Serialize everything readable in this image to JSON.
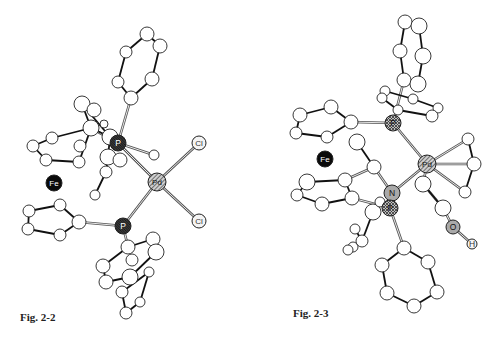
{
  "figures": [
    {
      "id": "fig-2-2",
      "caption": "Fig. 2-2",
      "atoms": [
        {
          "id": "a1",
          "x": 147,
          "y": 34,
          "r": 7
        },
        {
          "id": "a2",
          "x": 160,
          "y": 46,
          "r": 7
        },
        {
          "id": "a3",
          "x": 126,
          "y": 52,
          "r": 6
        },
        {
          "id": "a4",
          "x": 152,
          "y": 79,
          "r": 7
        },
        {
          "id": "a5",
          "x": 118,
          "y": 82,
          "r": 6
        },
        {
          "id": "a6",
          "x": 131,
          "y": 98,
          "r": 7
        },
        {
          "id": "b1",
          "x": 82,
          "y": 104,
          "r": 8
        },
        {
          "id": "b2",
          "x": 94,
          "y": 110,
          "r": 7
        },
        {
          "id": "b3",
          "x": 52,
          "y": 138,
          "r": 6
        },
        {
          "id": "b4",
          "x": 33,
          "y": 146,
          "r": 6
        },
        {
          "id": "b5",
          "x": 46,
          "y": 160,
          "r": 6
        },
        {
          "id": "b6",
          "x": 80,
          "y": 146,
          "r": 6
        },
        {
          "id": "b7",
          "x": 79,
          "y": 162,
          "r": 6
        },
        {
          "id": "b8",
          "x": 91,
          "y": 128,
          "r": 8
        },
        {
          "id": "b9",
          "x": 110,
          "y": 137,
          "r": 8
        },
        {
          "id": "b10",
          "x": 108,
          "y": 157,
          "r": 8
        },
        {
          "id": "b11",
          "x": 120,
          "y": 160,
          "r": 7
        },
        {
          "id": "b12",
          "x": 104,
          "y": 124,
          "r": 4
        },
        {
          "id": "b13",
          "x": 106,
          "y": 172,
          "r": 6
        },
        {
          "id": "b14",
          "x": 95,
          "y": 195,
          "r": 5
        },
        {
          "id": "b15",
          "x": 154,
          "y": 155,
          "r": 5
        },
        {
          "id": "c1",
          "x": 29,
          "y": 211,
          "r": 6
        },
        {
          "id": "c2",
          "x": 60,
          "y": 205,
          "r": 6
        },
        {
          "id": "c3",
          "x": 28,
          "y": 229,
          "r": 6
        },
        {
          "id": "c4",
          "x": 79,
          "y": 222,
          "r": 7
        },
        {
          "id": "c5",
          "x": 60,
          "y": 235,
          "r": 6
        },
        {
          "id": "d1",
          "x": 128,
          "y": 247,
          "r": 7
        },
        {
          "id": "d2",
          "x": 153,
          "y": 239,
          "r": 7
        },
        {
          "id": "d3",
          "x": 156,
          "y": 252,
          "r": 8
        },
        {
          "id": "d4",
          "x": 132,
          "y": 260,
          "r": 6
        },
        {
          "id": "d5",
          "x": 103,
          "y": 266,
          "r": 7
        },
        {
          "id": "d6",
          "x": 106,
          "y": 282,
          "r": 7
        },
        {
          "id": "d7",
          "x": 130,
          "y": 277,
          "r": 8
        },
        {
          "id": "d8",
          "x": 149,
          "y": 272,
          "r": 5
        },
        {
          "id": "d9",
          "x": 122,
          "y": 292,
          "r": 6
        },
        {
          "id": "d10",
          "x": 140,
          "y": 302,
          "r": 5
        },
        {
          "id": "d11",
          "x": 126,
          "y": 313,
          "r": 6
        }
      ],
      "bonds": [
        [
          "a1",
          "a2"
        ],
        [
          "a1",
          "a3"
        ],
        [
          "a2",
          "a4"
        ],
        [
          "a3",
          "a5"
        ],
        [
          "a5",
          "a6"
        ],
        [
          "a4",
          "a6"
        ],
        [
          "b4",
          "b3"
        ],
        [
          "b3",
          "b8"
        ],
        [
          "b4",
          "b5"
        ],
        [
          "b5",
          "b7"
        ],
        [
          "b7",
          "b8"
        ],
        [
          "b8",
          "b9"
        ],
        [
          "b9",
          "b10"
        ],
        [
          "b10",
          "b13"
        ],
        [
          "b13",
          "b14"
        ],
        [
          "b1",
          "b8"
        ],
        [
          "b1",
          "b9"
        ],
        [
          "c1",
          "c2"
        ],
        [
          "c1",
          "c3"
        ],
        [
          "c2",
          "c4"
        ],
        [
          "c3",
          "c5"
        ],
        [
          "c5",
          "c4"
        ],
        [
          "d1",
          "d2"
        ],
        [
          "d1",
          "d5"
        ],
        [
          "d5",
          "d6"
        ],
        [
          "d6",
          "d7"
        ],
        [
          "d7",
          "d3"
        ],
        [
          "d3",
          "d2"
        ],
        [
          "d8",
          "d9"
        ],
        [
          "d9",
          "d11"
        ],
        [
          "d11",
          "d10"
        ],
        [
          "d10",
          "d8"
        ]
      ],
      "metal_bonds": [
        [
          "P1",
          "a6"
        ],
        [
          "P1",
          "Pd"
        ],
        [
          "P2",
          "Pd"
        ],
        [
          "Pd",
          "Cl1"
        ],
        [
          "Pd",
          "Cl2"
        ],
        [
          "P2",
          "c4"
        ],
        [
          "P2",
          "d1"
        ],
        [
          "P1",
          "b8"
        ],
        [
          "P1",
          "b15"
        ]
      ],
      "labeled_atoms": [
        {
          "id": "P1",
          "label": "P",
          "x": 118,
          "y": 143,
          "r": 8,
          "style": "dark"
        },
        {
          "id": "P2",
          "label": "P",
          "x": 123,
          "y": 226,
          "r": 8,
          "style": "dark"
        },
        {
          "id": "Pd",
          "label": "Pd",
          "x": 157,
          "y": 182,
          "r": 9,
          "style": "hatched"
        },
        {
          "id": "Cl1",
          "label": "Cl",
          "x": 199,
          "y": 143,
          "r": 7,
          "style": "light"
        },
        {
          "id": "Cl2",
          "label": "Cl",
          "x": 199,
          "y": 221,
          "r": 7,
          "style": "light"
        },
        {
          "id": "Fe",
          "label": "Fe",
          "x": 54,
          "y": 183,
          "r": 8,
          "style": "black"
        }
      ]
    },
    {
      "id": "fig-2-3",
      "caption": "Fig. 2-3",
      "atoms": [
        {
          "id": "e1",
          "x": 405,
          "y": 22,
          "r": 7
        },
        {
          "id": "e2",
          "x": 419,
          "y": 26,
          "r": 8
        },
        {
          "id": "e3",
          "x": 400,
          "y": 51,
          "r": 7
        },
        {
          "id": "e4",
          "x": 423,
          "y": 56,
          "r": 8
        },
        {
          "id": "e5",
          "x": 404,
          "y": 80,
          "r": 7
        },
        {
          "id": "e6",
          "x": 418,
          "y": 84,
          "r": 8
        },
        {
          "id": "f1",
          "x": 385,
          "y": 91,
          "r": 5
        },
        {
          "id": "f2",
          "x": 382,
          "y": 98,
          "r": 5
        },
        {
          "id": "f3",
          "x": 413,
          "y": 99,
          "r": 5
        },
        {
          "id": "f4",
          "x": 438,
          "y": 108,
          "r": 5
        },
        {
          "id": "f5",
          "x": 432,
          "y": 116,
          "r": 6
        },
        {
          "id": "f6",
          "x": 398,
          "y": 110,
          "r": 5
        },
        {
          "id": "g1",
          "x": 300,
          "y": 115,
          "r": 7
        },
        {
          "id": "g2",
          "x": 331,
          "y": 107,
          "r": 7
        },
        {
          "id": "g3",
          "x": 296,
          "y": 133,
          "r": 6
        },
        {
          "id": "g4",
          "x": 351,
          "y": 122,
          "r": 7
        },
        {
          "id": "g5",
          "x": 327,
          "y": 137,
          "r": 6
        },
        {
          "id": "h1",
          "x": 357,
          "y": 142,
          "r": 8
        },
        {
          "id": "h2",
          "x": 374,
          "y": 167,
          "r": 7
        },
        {
          "id": "h3",
          "x": 345,
          "y": 180,
          "r": 7
        },
        {
          "id": "h4",
          "x": 307,
          "y": 182,
          "r": 8
        },
        {
          "id": "h5",
          "x": 297,
          "y": 195,
          "r": 6
        },
        {
          "id": "h6",
          "x": 322,
          "y": 204,
          "r": 7
        },
        {
          "id": "h7",
          "x": 352,
          "y": 198,
          "r": 7
        },
        {
          "id": "h8",
          "x": 373,
          "y": 212,
          "r": 8
        },
        {
          "id": "h9",
          "x": 355,
          "y": 229,
          "r": 5
        },
        {
          "id": "h10",
          "x": 353,
          "y": 247,
          "r": 5
        },
        {
          "id": "h11",
          "x": 362,
          "y": 241,
          "r": 6
        },
        {
          "id": "h12",
          "x": 348,
          "y": 250,
          "r": 5
        },
        {
          "id": "h13",
          "x": 380,
          "y": 202,
          "r": 5
        },
        {
          "id": "i1",
          "x": 468,
          "y": 139,
          "r": 6
        },
        {
          "id": "i2",
          "x": 474,
          "y": 164,
          "r": 7
        },
        {
          "id": "i3",
          "x": 465,
          "y": 192,
          "r": 6
        },
        {
          "id": "i4",
          "x": 423,
          "y": 184,
          "r": 8
        },
        {
          "id": "i5",
          "x": 443,
          "y": 208,
          "r": 8
        },
        {
          "id": "j1",
          "x": 404,
          "y": 248,
          "r": 7
        },
        {
          "id": "j2",
          "x": 382,
          "y": 265,
          "r": 7
        },
        {
          "id": "j3",
          "x": 428,
          "y": 262,
          "r": 7
        },
        {
          "id": "j4",
          "x": 387,
          "y": 293,
          "r": 7
        },
        {
          "id": "j5",
          "x": 437,
          "y": 292,
          "r": 7
        },
        {
          "id": "j6",
          "x": 414,
          "y": 306,
          "r": 7
        }
      ],
      "bonds": [
        [
          "e1",
          "e3"
        ],
        [
          "e2",
          "e4"
        ],
        [
          "e3",
          "e5"
        ],
        [
          "e4",
          "e6"
        ],
        [
          "e1",
          "e2"
        ],
        [
          "e5",
          "e6"
        ],
        [
          "f1",
          "f2"
        ],
        [
          "f2",
          "f6"
        ],
        [
          "f1",
          "f3"
        ],
        [
          "f3",
          "f4"
        ],
        [
          "f4",
          "f5"
        ],
        [
          "f6",
          "f5"
        ],
        [
          "g1",
          "g2"
        ],
        [
          "g1",
          "g3"
        ],
        [
          "g2",
          "g4"
        ],
        [
          "g3",
          "g5"
        ],
        [
          "g5",
          "g4"
        ],
        [
          "h1",
          "h2"
        ],
        [
          "h4",
          "h3"
        ],
        [
          "h4",
          "h5"
        ],
        [
          "h5",
          "h6"
        ],
        [
          "h6",
          "h7"
        ],
        [
          "h3",
          "h7"
        ],
        [
          "h9",
          "h11"
        ],
        [
          "h11",
          "h10"
        ],
        [
          "h10",
          "h12"
        ],
        [
          "h8",
          "h11"
        ],
        [
          "i1",
          "i2"
        ],
        [
          "i2",
          "i3"
        ],
        [
          "i4",
          "i5"
        ],
        [
          "j1",
          "j2"
        ],
        [
          "j1",
          "j3"
        ],
        [
          "j2",
          "j4"
        ],
        [
          "j3",
          "j5"
        ],
        [
          "j4",
          "j6"
        ],
        [
          "j5",
          "j6"
        ]
      ],
      "metal_bonds": [
        [
          "P1",
          "e5"
        ],
        [
          "P1",
          "g4"
        ],
        [
          "P1",
          "Pd"
        ],
        [
          "Pd",
          "i1"
        ],
        [
          "Pd",
          "i2"
        ],
        [
          "Pd",
          "i3"
        ],
        [
          "Pd",
          "N"
        ],
        [
          "Pd",
          "i4"
        ],
        [
          "N",
          "h2"
        ],
        [
          "N",
          "P2"
        ],
        [
          "P2",
          "j1"
        ],
        [
          "P2",
          "h7"
        ],
        [
          "i4",
          "i5"
        ],
        [
          "i5",
          "O"
        ],
        [
          "O",
          "H"
        ],
        [
          "h3",
          "h2"
        ]
      ],
      "labeled_atoms": [
        {
          "id": "P1",
          "label": "P",
          "x": 393,
          "y": 123,
          "r": 8,
          "style": "cross"
        },
        {
          "id": "Pd",
          "label": "Pd",
          "x": 427,
          "y": 164,
          "r": 9,
          "style": "hatched"
        },
        {
          "id": "N",
          "label": "N",
          "x": 392,
          "y": 193,
          "r": 8,
          "style": "grey"
        },
        {
          "id": "P2",
          "label": "P",
          "x": 390,
          "y": 208,
          "r": 8,
          "style": "cross"
        },
        {
          "id": "O",
          "label": "O",
          "x": 453,
          "y": 227,
          "r": 7,
          "style": "grey"
        },
        {
          "id": "H",
          "label": "H",
          "x": 472,
          "y": 244,
          "r": 5,
          "style": "light"
        },
        {
          "id": "Fe",
          "label": "Fe",
          "x": 325,
          "y": 159,
          "r": 8,
          "style": "black"
        }
      ]
    }
  ]
}
